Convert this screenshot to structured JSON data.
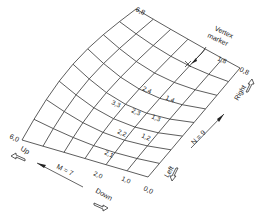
{
  "diagram": {
    "mesh": {
      "m_count": 7,
      "n_count": 9,
      "corners": {
        "m0_n0": [
          148,
          177
        ],
        "m6_n0": [
          22,
          140
        ],
        "m6_n8": [
          136,
          12
        ],
        "m0_n8": [
          240,
          68
        ]
      }
    },
    "corner_labels": {
      "c00": "0,0",
      "c60": "6,0",
      "c68": "6,8",
      "c08": "0,8"
    },
    "vertex_labels": [
      {
        "text": "1,0",
        "x": 121,
        "y": 180
      },
      {
        "text": "2,0",
        "x": 93,
        "y": 175
      },
      {
        "text": "2,1",
        "x": 104,
        "y": 154
      },
      {
        "text": "2,2",
        "x": 117,
        "y": 133
      },
      {
        "text": "1,2",
        "x": 141,
        "y": 137
      },
      {
        "text": "2,3",
        "x": 131,
        "y": 112
      },
      {
        "text": "1,3",
        "x": 151,
        "y": 118
      },
      {
        "text": "3,3",
        "x": 111,
        "y": 104
      },
      {
        "text": "2,4",
        "x": 142,
        "y": 90
      },
      {
        "text": "1,4",
        "x": 165,
        "y": 99
      },
      {
        "text": "1,8",
        "x": 217,
        "y": 60
      }
    ],
    "vertex_marker": {
      "label_line1": "Vertex",
      "label_line2": "marker",
      "x": 187,
      "y": 65
    },
    "axis_labels": {
      "m_label": "M = 7",
      "n_label": "N = 9"
    },
    "direction_labels": {
      "up": "Up",
      "down": "Down",
      "left": "Left",
      "right": "Right"
    }
  }
}
